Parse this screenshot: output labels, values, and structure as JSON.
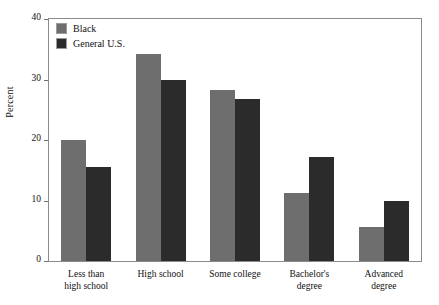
{
  "chart_data": {
    "type": "bar",
    "title": "",
    "xlabel": "",
    "ylabel": "Percent",
    "ylim": [
      0,
      40
    ],
    "yticks": [
      0,
      10,
      20,
      30,
      40
    ],
    "ytick_labels": [
      "0",
      "10",
      "20",
      "30",
      "40"
    ],
    "grid": false,
    "legend_position": "top-left",
    "categories": [
      "Less than high school",
      "High school",
      "Some college",
      "Bachelor's degree",
      "Advanced degree"
    ],
    "category_lines": [
      [
        "Less than",
        "high school"
      ],
      [
        "High school"
      ],
      [
        "Some college"
      ],
      [
        "Bachelor's",
        "degree"
      ],
      [
        "Advanced",
        "degree"
      ]
    ],
    "series": [
      {
        "name": "Black",
        "color": "#6e6e6e",
        "values": [
          20.0,
          34.2,
          28.3,
          11.3,
          5.6
        ]
      },
      {
        "name": "General U.S.",
        "color": "#2b2b2b",
        "values": [
          15.5,
          30.0,
          26.7,
          17.2,
          10.0
        ]
      }
    ]
  },
  "legend": {
    "items": [
      {
        "label": "Black",
        "color": "#6e6e6e"
      },
      {
        "label": "General U.S.",
        "color": "#2b2b2b"
      }
    ]
  },
  "colors": {
    "series_black": "#6e6e6e",
    "series_general_us": "#2b2b2b",
    "frame": "#8a8a8a",
    "text": "#111111",
    "background": "#ffffff"
  }
}
